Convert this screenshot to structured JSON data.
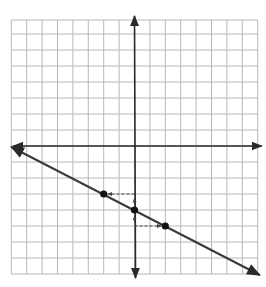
{
  "chart_data": {
    "type": "line",
    "title": "",
    "xlabel": "",
    "ylabel": "",
    "xlim": [
      -8,
      8
    ],
    "ylim": [
      -8,
      8
    ],
    "grid": true,
    "grid_step": 1,
    "axes": {
      "x_arrows": true,
      "y_arrows": true
    },
    "line": {
      "equation": "y = -1/2 x - 4",
      "slope": -0.5,
      "y_intercept": -4,
      "from": [
        -8,
        0
      ],
      "to": [
        8,
        -8
      ],
      "arrows_both_ends": true
    },
    "points": [
      {
        "x": -2,
        "y": -3
      },
      {
        "x": 0,
        "y": -4
      },
      {
        "x": 2,
        "y": -5
      }
    ],
    "dashed_guides": [
      {
        "from": [
          0,
          -4
        ],
        "to": [
          0,
          -3
        ],
        "arrow": true
      },
      {
        "from": [
          0,
          -3
        ],
        "to": [
          -2,
          -3
        ],
        "arrow": true
      },
      {
        "from": [
          0,
          -4
        ],
        "to": [
          0,
          -5
        ],
        "arrow": true
      },
      {
        "from": [
          0,
          -5
        ],
        "to": [
          2,
          -5
        ],
        "arrow": true
      }
    ]
  },
  "colors": {
    "grid": "#b8b8b8",
    "axis": "#2a2a2a",
    "line": "#3a3a3a",
    "point": "#111111",
    "guide": "#444444"
  },
  "layout": {
    "origin_px": [
      134.5,
      146
    ],
    "unit_x_px": 15.4,
    "unit_y_px": 16,
    "grid_top_px": 20
  }
}
